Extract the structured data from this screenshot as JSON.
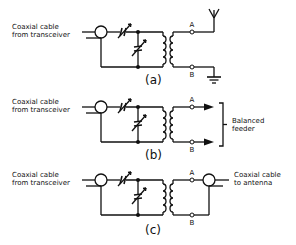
{
  "figure": {
    "panels": [
      {
        "id": "a",
        "caption": "(a)",
        "input_label_line1": "Coaxial cable",
        "input_label_line2": "from transceiver",
        "terminal_a": "A",
        "terminal_b": "B",
        "output": "antenna-and-ground"
      },
      {
        "id": "b",
        "caption": "(b)",
        "input_label_line1": "Coaxial cable",
        "input_label_line2": "from transceiver",
        "terminal_a": "A",
        "terminal_b": "B",
        "output": "balanced-feeder",
        "output_label_line1": "Balanced",
        "output_label_line2": "feeder"
      },
      {
        "id": "c",
        "caption": "(c)",
        "input_label_line1": "Coaxial cable",
        "input_label_line2": "from transceiver",
        "terminal_a": "A",
        "terminal_b": "B",
        "output": "coaxial-cable",
        "output_label_line1": "Coaxial cable",
        "output_label_line2": "to antenna"
      }
    ],
    "colors": {
      "ink": "#111111",
      "background": "#ffffff"
    }
  }
}
